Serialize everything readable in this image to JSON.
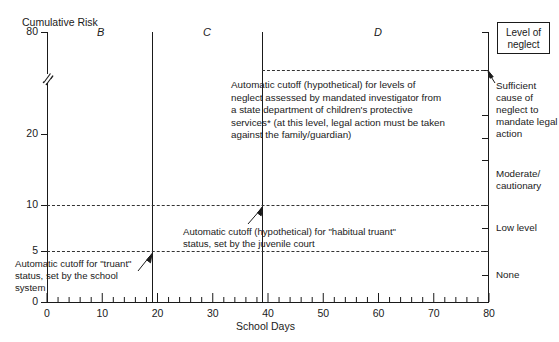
{
  "chart_data": {
    "type": "line",
    "title": "",
    "ylabel": "Cumulative Risk",
    "xlabel": "School Days",
    "xlim": [
      0,
      80
    ],
    "ylim": [
      0,
      80
    ],
    "grid": false,
    "legend_position": "right",
    "axis_break": {
      "axis": "y",
      "between": [
        20,
        80
      ],
      "symbol": "//"
    },
    "x_ticks": [
      0,
      10,
      20,
      30,
      40,
      50,
      60,
      70,
      80
    ],
    "x_minor_tick_step": 2,
    "y_ticks": [
      0,
      5,
      10,
      20,
      80
    ],
    "right_axis_ticks": [
      5,
      10,
      12.5,
      15,
      20
    ],
    "region_labels": [
      {
        "label": "B",
        "x_start": 0,
        "x_end": 20
      },
      {
        "label": "C",
        "x_start": 20,
        "x_end": 40
      },
      {
        "label": "D",
        "x_start": 40,
        "x_end": 80
      }
    ],
    "region_dividers_x": [
      20,
      40
    ],
    "threshold_lines": [
      {
        "value": 5,
        "label": "truant cutoff",
        "style": "dashed",
        "x_start": 0,
        "x_end": 80
      },
      {
        "value": 10,
        "label": "habitual truant cutoff",
        "style": "dashed",
        "x_start": 0,
        "x_end": 80
      },
      {
        "value": 27,
        "label": "neglect cutoff",
        "style": "dashed",
        "x_start": 40,
        "x_end": 80
      }
    ],
    "right_scale_categories": [
      {
        "label": "Sufficient cause of neglect to mandate legal action",
        "from": 15,
        "to": 27
      },
      {
        "label": "Moderate/ cautionary",
        "from": 10,
        "to": 15
      },
      {
        "label": "Low level",
        "from": 7.5,
        "to": 10
      },
      {
        "label": "None",
        "from": 0,
        "to": 7.5
      }
    ],
    "annotations": [
      "Automatic cutoff (hypothetical) for levels of neglect assessed by mandated investigator from a state department of children's protective services* (at this level, legal action must be taken against the family/guardian)",
      "Automatic cutoff (hypothetical) for \"habitual truant\" status, set by the juvenile court",
      "Automatic cutoff for \"truant\" status, set by the school system"
    ]
  },
  "axes": {
    "y_title": "Cumulative Risk",
    "x_title": "School Days",
    "y_ticks": [
      "80",
      "20",
      "10",
      "5",
      "0"
    ],
    "x_ticks": [
      "0",
      "10",
      "20",
      "30",
      "40",
      "50",
      "60",
      "70",
      "80"
    ]
  },
  "regions": {
    "b": "B",
    "c": "C",
    "d": "D"
  },
  "annotations": {
    "neglect_cutoff": "Automatic cutoff (hypothetical) for levels of neglect assessed by mandated investigator from a state department of children's protective services* (at this level, legal action must be taken against the family/guardian)",
    "habitual_truant_cutoff": "Automatic cutoff (hypothetical) for \"habitual truant\" status, set by the juvenile court",
    "truant_cutoff": "Automatic cutoff for \"truant\" status, set by the school system"
  },
  "legend": {
    "box_title": "Level of neglect",
    "items": [
      "Sufficient cause of neglect to mandate legal action",
      "Moderate/ cautionary",
      "Low level",
      "None"
    ],
    "item_sufficient": "Sufficient cause of neglect to mandate legal action",
    "item_moderate": "Moderate/ cautionary",
    "item_low": "Low level",
    "item_none": "None"
  },
  "colors": {
    "ink": "#1a1a1a",
    "dashed": "#333333",
    "background": "#ffffff"
  }
}
